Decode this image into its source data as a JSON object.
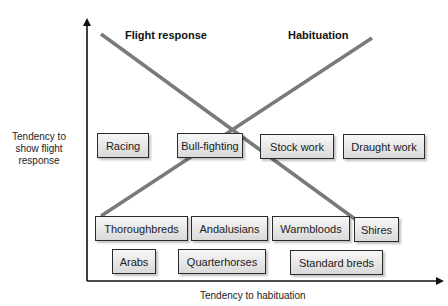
{
  "diagram": {
    "y_axis_label": [
      "Tendency to",
      "show flight",
      "response"
    ],
    "x_axis_label": "Tendency to habituation",
    "lines": [
      {
        "name": "Flight response",
        "from": [
          101,
          34
        ],
        "to": [
          370,
          230
        ],
        "color": "#7a7a7a"
      },
      {
        "name": "Habituation",
        "from": [
          101,
          216
        ],
        "to": [
          372,
          38
        ],
        "color": "#7a7a7a"
      }
    ],
    "line_labels": {
      "flight_response": "Flight response",
      "habituation": "Habituation"
    },
    "uses": [
      "Racing",
      "Bull-fighting",
      "Stock work",
      "Draught work"
    ],
    "breeds_row1": [
      "Thoroughbreds",
      "Andalusians",
      "Warmbloods",
      "Shires"
    ],
    "breeds_row2": [
      "Arabs",
      "Quarterhorses",
      "Standard breds"
    ]
  }
}
